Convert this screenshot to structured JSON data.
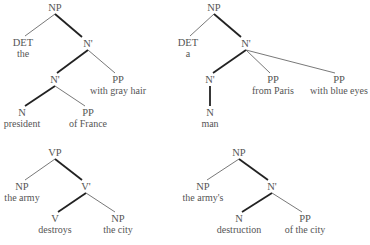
{
  "trees": [
    {
      "id": "tree-1",
      "nodes": [
        {
          "cat": "NP",
          "x": 55,
          "y": 2
        },
        {
          "cat": "DET",
          "word": "the",
          "x": 23,
          "y": 37
        },
        {
          "cat": "N'",
          "x": 88,
          "y": 38
        },
        {
          "cat": "N'",
          "x": 55,
          "y": 74
        },
        {
          "cat": "PP",
          "word": "with gray hair",
          "x": 118,
          "y": 74
        },
        {
          "cat": "N",
          "word": "president",
          "x": 22,
          "y": 107
        },
        {
          "cat": "PP",
          "word": "of France",
          "x": 88,
          "y": 107
        }
      ]
    },
    {
      "id": "tree-2",
      "nodes": [
        {
          "cat": "NP",
          "x": 214,
          "y": 2
        },
        {
          "cat": "DET",
          "word": "a",
          "x": 188,
          "y": 37
        },
        {
          "cat": "N'",
          "x": 246,
          "y": 38
        },
        {
          "cat": "N'",
          "x": 210,
          "y": 74
        },
        {
          "cat": "PP",
          "word": "from Paris",
          "x": 273,
          "y": 74
        },
        {
          "cat": "PP",
          "word": "with blue eyes",
          "x": 339,
          "y": 74
        },
        {
          "cat": "N",
          "word": "man",
          "x": 210,
          "y": 107
        }
      ]
    },
    {
      "id": "tree-3",
      "nodes": [
        {
          "cat": "VP",
          "x": 55,
          "y": 147
        },
        {
          "cat": "NP",
          "word": "the army",
          "x": 22,
          "y": 181
        },
        {
          "cat": "V'",
          "x": 86,
          "y": 181
        },
        {
          "cat": "V",
          "word": "destroys",
          "x": 55,
          "y": 213
        },
        {
          "cat": "NP",
          "word": "the city",
          "x": 118,
          "y": 213
        }
      ]
    },
    {
      "id": "tree-4",
      "nodes": [
        {
          "cat": "NP",
          "x": 239,
          "y": 147
        },
        {
          "cat": "NP",
          "word": "the army's",
          "x": 203,
          "y": 181
        },
        {
          "cat": "N'",
          "x": 272,
          "y": 181
        },
        {
          "cat": "N",
          "word": "destruction",
          "x": 239,
          "y": 213
        },
        {
          "cat": "PP",
          "word": "of the city",
          "x": 305,
          "y": 213
        }
      ]
    }
  ],
  "edge_colors": {
    "thin": "#555555",
    "thick": "#222222"
  }
}
